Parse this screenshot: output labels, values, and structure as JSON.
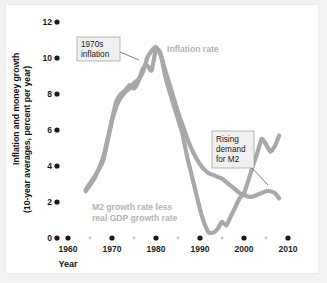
{
  "figure": {
    "background_color": "#f2f2f2",
    "plot_background_color": "#ffffff",
    "curve_color": "#a8a8a8",
    "label_color": "#b3b3b3",
    "axis_color": "#1b1b1b"
  },
  "chart_data": {
    "type": "line",
    "title": "",
    "subtitle": "",
    "xlabel": "Year",
    "ylabel": "Inflation and money growth (10-year averages, percent per year)",
    "ylabel_line1": "Inflation and money growth",
    "ylabel_line2": "(10-year averages, percent per year)",
    "xlim": [
      1958,
      2011
    ],
    "ylim": [
      0,
      12
    ],
    "grid": false,
    "legend_position": "inline-labels",
    "x_major_ticks": [
      1960,
      1970,
      1980,
      1990,
      2000,
      2010
    ],
    "x_minor_ticks": [
      1965,
      1975,
      1985,
      1995,
      2005
    ],
    "x_tick_labels": [
      "1960",
      "1970",
      "1980",
      "1990",
      "2000",
      "2010"
    ],
    "y_ticks": [
      0,
      2,
      4,
      6,
      8,
      10,
      12
    ],
    "y_tick_labels": [
      "0",
      "2",
      "4",
      "6",
      "8",
      "10",
      "12"
    ],
    "series": [
      {
        "name": "Inflation rate",
        "label": "Inflation rate",
        "color": "#a8a8a8",
        "x": [
          1964,
          1966,
          1968,
          1970,
          1971,
          1972,
          1973,
          1974,
          1975,
          1976,
          1977,
          1978,
          1979,
          1980,
          1981,
          1982,
          1983,
          1984,
          1985,
          1986,
          1987,
          1988,
          1989,
          1990,
          1991,
          1992,
          1993,
          1994,
          1995,
          1996,
          1997,
          1998,
          1999,
          2000,
          2001,
          2002,
          2003,
          2004,
          2005,
          2006,
          2007,
          2008
        ],
        "y": [
          2.7,
          3.4,
          4.3,
          6.5,
          7.3,
          7.8,
          8.1,
          8.3,
          8.6,
          8.8,
          9.2,
          10.0,
          10.4,
          10.6,
          10.2,
          9.4,
          8.6,
          7.8,
          7.0,
          6.3,
          5.6,
          5.0,
          4.5,
          4.1,
          3.8,
          3.6,
          3.5,
          3.4,
          3.3,
          3.1,
          2.9,
          2.7,
          2.5,
          2.4,
          2.3,
          2.3,
          2.4,
          2.5,
          2.6,
          2.6,
          2.5,
          2.2
        ]
      },
      {
        "name": "M2 growth rate less real GDP growth rate",
        "label": "M2 growth rate less real GDP growth rate",
        "color": "#a8a8a8",
        "x": [
          1964,
          1966,
          1968,
          1970,
          1971,
          1972,
          1973,
          1974,
          1975,
          1976,
          1977,
          1978,
          1979,
          1980,
          1981,
          1982,
          1983,
          1984,
          1985,
          1986,
          1987,
          1988,
          1989,
          1990,
          1991,
          1992,
          1993,
          1994,
          1995,
          1996,
          1997,
          1998,
          1999,
          2000,
          2001,
          2002,
          2003,
          2004,
          2005,
          2006,
          2007,
          2008
        ],
        "y": [
          2.6,
          3.3,
          4.5,
          6.6,
          7.6,
          8.0,
          8.2,
          8.5,
          8.3,
          8.7,
          9.4,
          9.6,
          9.3,
          10.5,
          10.3,
          9.1,
          8.2,
          7.4,
          6.6,
          5.8,
          4.6,
          3.6,
          2.6,
          1.6,
          0.8,
          0.3,
          0.3,
          0.5,
          0.9,
          0.7,
          1.2,
          1.7,
          2.2,
          2.5,
          3.2,
          4.0,
          4.7,
          5.5,
          5.2,
          4.8,
          5.1,
          5.7
        ]
      }
    ],
    "annotations": [
      {
        "id": "1970s-inflation",
        "text_lines": [
          "1970s",
          "inflation"
        ],
        "text": "1970s inflation",
        "target_x": 1978,
        "target_y": 9.6
      },
      {
        "id": "rising-demand-m2",
        "text_lines": [
          "Rising",
          "demand",
          "for M2"
        ],
        "text": "Rising demand for M2",
        "target_x": 2001,
        "target_y": 3.3
      }
    ],
    "inline_labels": [
      {
        "id": "inflation-rate-label",
        "text": "Inflation rate",
        "x": 1986,
        "y": 10.1
      },
      {
        "id": "m2-growth-label",
        "text_lines": [
          "M2 growth rate less",
          "real GDP growth rate"
        ],
        "text": "M2 growth rate less real GDP growth rate",
        "x": 1974,
        "y": 1.9
      }
    ]
  }
}
